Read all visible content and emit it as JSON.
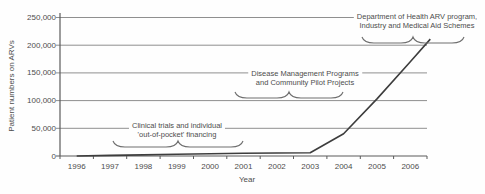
{
  "chart_data": {
    "type": "line",
    "title": "",
    "xlabel": "Year",
    "ylabel": "Patient numbers on ARVs",
    "x_tick_labels": [
      "1996",
      "1997",
      "1998",
      "1999",
      "2000",
      "2001",
      "2002",
      "2003",
      "2004",
      "2005",
      "2006"
    ],
    "y_tick_labels": [
      "0",
      "50,000",
      "100,000",
      "150,000",
      "200,000",
      "250,000"
    ],
    "y_tick_values": [
      0,
      50000,
      100000,
      150000,
      200000,
      250000
    ],
    "ylim": [
      0,
      250000
    ],
    "grid": "horizontal gridlines at every 50,000",
    "legend": "none",
    "series": [
      {
        "name": "Patient numbers on ARVs",
        "x": [
          1996,
          1997,
          1998,
          1999,
          2000,
          2001,
          2002,
          2003,
          2004,
          2005,
          2006,
          2006.6
        ],
        "values": [
          0,
          1000,
          2000,
          3000,
          4000,
          5000,
          5500,
          6000,
          40000,
          103000,
          170000,
          211000
        ]
      }
    ],
    "annotations": [
      {
        "lines": [
          "Clinical trials and individual",
          "'out-of-pocket' financing"
        ],
        "brace_span_years": "1997–2000"
      },
      {
        "lines": [
          "Disease Management Programs",
          "and Community Pilot Projects"
        ],
        "brace_span_years": "2001–2003"
      },
      {
        "lines": [
          "Department of Health ARV program,",
          "Industry and Medical Aid Schemes"
        ],
        "brace_span_years": "2004–2006"
      }
    ]
  },
  "colors": {
    "background": "#fefefe",
    "text": "#4d4d4d",
    "grid": "#8f8f8f",
    "axis": "#5a5a5a",
    "line": "#3d3d3d",
    "brace": "#6e6e6e"
  }
}
